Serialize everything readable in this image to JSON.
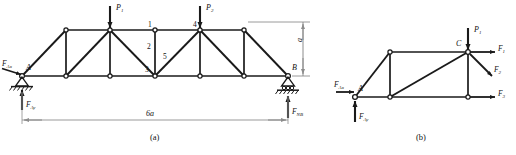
{
  "figure": {
    "caption_a": "(a)",
    "caption_b": "(b)"
  },
  "diagram_a": {
    "name": "full-truss-free-body",
    "span_dimension": "6a",
    "height_dimension": "a",
    "supports": [
      {
        "id": "A",
        "label": "A",
        "type": "pin-support"
      },
      {
        "id": "B",
        "label": "B",
        "type": "roller-support"
      }
    ],
    "loads": [
      {
        "name": "P1",
        "base": "P",
        "sub": "1",
        "direction": "down"
      },
      {
        "name": "P2",
        "base": "P",
        "sub": "2",
        "direction": "down"
      }
    ],
    "reactions": [
      {
        "name": "FAx",
        "base": "F",
        "sub": "Ax",
        "direction": "right"
      },
      {
        "name": "FAy",
        "base": "F",
        "sub": "Ay",
        "direction": "up"
      },
      {
        "name": "FNB",
        "base": "F",
        "sub": "NB",
        "direction": "up"
      }
    ],
    "member_labels": [
      "1",
      "2",
      "3",
      "4",
      "5"
    ]
  },
  "diagram_b": {
    "name": "section-free-body",
    "points": [
      {
        "id": "A",
        "label": "A"
      },
      {
        "id": "C",
        "label": "C"
      }
    ],
    "loads": [
      {
        "name": "P1",
        "base": "P",
        "sub": "1",
        "direction": "down"
      }
    ],
    "reactions": [
      {
        "name": "FAx",
        "base": "F",
        "sub": "Ax",
        "direction": "right"
      },
      {
        "name": "FAy",
        "base": "F",
        "sub": "Ay",
        "direction": "up"
      }
    ],
    "internal_forces": [
      {
        "name": "F1",
        "base": "F",
        "sub": "1",
        "direction": "right"
      },
      {
        "name": "F2",
        "base": "F",
        "sub": "2",
        "direction": "down-right"
      },
      {
        "name": "F3",
        "base": "F",
        "sub": "3",
        "direction": "right"
      }
    ]
  },
  "colors": {
    "line": "#1a1a1a",
    "dimension": "#9a9a9a",
    "background": "#ffffff"
  }
}
